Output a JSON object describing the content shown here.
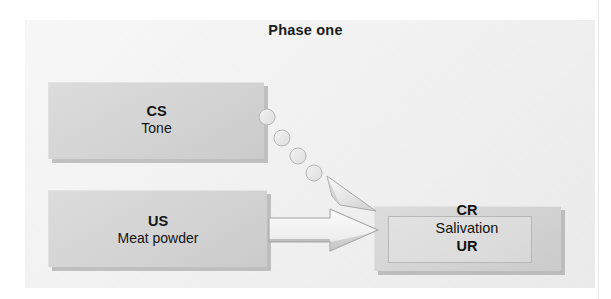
{
  "figure": {
    "title": "Phase one",
    "caption_present": false
  },
  "boxes": {
    "cs": {
      "code": "CS",
      "sublabel": "Tone"
    },
    "us": {
      "code": "US",
      "sublabel": "Meat powder"
    },
    "response": {
      "code": "CR",
      "sublabel": "Salivation",
      "code2": "UR"
    }
  },
  "connectors": {
    "dotted_arrow": {
      "name": "cs-to-response-dotted-arrow",
      "style": "dotted",
      "from": "CS",
      "to": "CR",
      "dot_count": 4
    },
    "solid_arrow": {
      "name": "us-to-response-solid-arrow",
      "style": "solid-outline",
      "from": "US",
      "to": "UR"
    }
  },
  "colors": {
    "panel_bg": "#efefef",
    "box_fill": "#d6d6d6",
    "box_shadow": "#969696",
    "text": "#141414",
    "arrow_fill": "#f2f2f2",
    "arrow_stroke": "#9a9a9a"
  }
}
